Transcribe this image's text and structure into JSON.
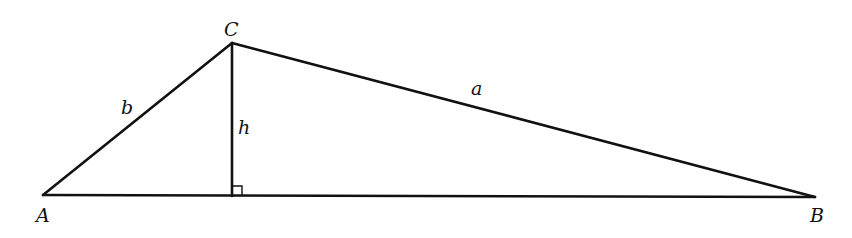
{
  "diagram": {
    "type": "triangle-with-altitude",
    "vertices": {
      "A": {
        "label": "A",
        "x": 43,
        "y": 195
      },
      "B": {
        "label": "B",
        "x": 815,
        "y": 197
      },
      "C": {
        "label": "C",
        "x": 232,
        "y": 43
      }
    },
    "altitude_foot": {
      "x": 232,
      "y": 196
    },
    "sides": {
      "a": {
        "label": "a",
        "from": "C",
        "to": "B"
      },
      "b": {
        "label": "b",
        "from": "A",
        "to": "C"
      }
    },
    "altitude": {
      "label": "h",
      "from": "C",
      "to": "foot"
    },
    "right_angle_marker": true,
    "colors": {
      "stroke": "#111111",
      "background": "#ffffff"
    }
  }
}
